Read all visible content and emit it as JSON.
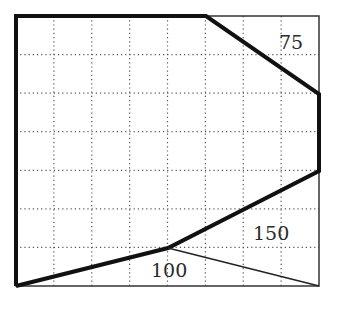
{
  "diagram": {
    "type": "grid-region-diagram",
    "grid": {
      "columns": 8,
      "rows": 7,
      "origin_px": [
        16,
        16
      ],
      "cell_width_px": 37.875,
      "cell_height_px": 38.571,
      "line_style": "dotted",
      "line_color": "#555555"
    },
    "frame": {
      "x": 16,
      "y": 16,
      "width": 303,
      "height": 270,
      "stroke": "#333333",
      "stroke_width": 1.5
    },
    "thick_boundary": {
      "stroke": "#111111",
      "stroke_width": 4,
      "points_grid": [
        [
          0,
          7
        ],
        [
          0,
          0
        ],
        [
          5,
          0
        ],
        [
          8,
          2
        ],
        [
          8,
          4
        ],
        [
          4,
          6
        ],
        [
          0,
          7
        ]
      ],
      "points_px": "16,286 16,16 206,16 319,94 319,171 168,248 16,286"
    },
    "thin_line": {
      "stroke": "#222222",
      "stroke_width": 1.5,
      "from_px": [
        168,
        248
      ],
      "to_px": [
        319,
        286
      ]
    },
    "labels": [
      {
        "text": "75",
        "x": 279,
        "y": 49
      },
      {
        "text": "150",
        "x": 253,
        "y": 240
      },
      {
        "text": "100",
        "x": 151,
        "y": 277
      }
    ]
  }
}
